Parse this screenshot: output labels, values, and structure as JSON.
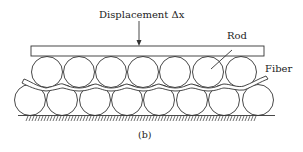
{
  "labels": {
    "displacement": "Displacement Δx",
    "rod": "Rod",
    "fiber": "Fiber",
    "caption": "(b)"
  },
  "diagram": {
    "plate": {
      "x": 31,
      "y": 46,
      "width": 233,
      "height": 10
    },
    "top_row_rods": 7,
    "bottom_row_rods": 8,
    "stroke_color": "#333333"
  }
}
